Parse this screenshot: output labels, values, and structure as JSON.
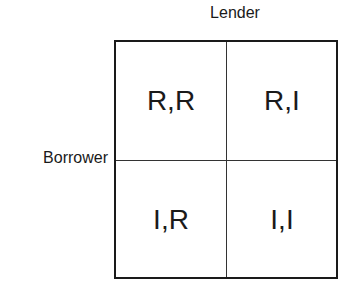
{
  "diagram": {
    "column_label": "Lender",
    "row_label": "Borrower",
    "cells": [
      [
        "R,R",
        "R,I"
      ],
      [
        "I,R",
        "I,I"
      ]
    ]
  }
}
